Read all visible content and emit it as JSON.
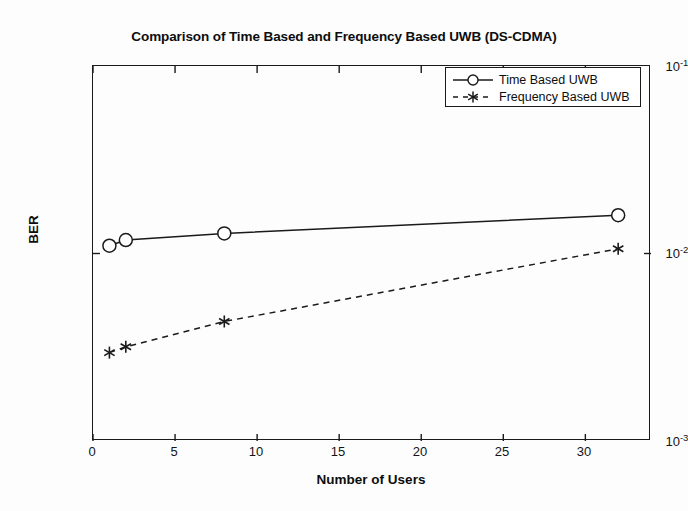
{
  "chart_data": {
    "type": "line",
    "title": "Comparison of Time Based and Frequency Based UWB (DS-CDMA)",
    "xlabel": "Number of Users",
    "ylabel": "BER",
    "yscale": "log",
    "xlim": [
      0,
      34
    ],
    "ylim": [
      0.001,
      0.1
    ],
    "grid": false,
    "legend_position": "top-right",
    "xticks": [
      "0",
      "5",
      "10",
      "15",
      "20",
      "25",
      "30"
    ],
    "xtick_values": [
      0,
      5,
      10,
      15,
      20,
      25,
      30
    ],
    "yticks": [
      "10-1",
      "10-2",
      "10-3"
    ],
    "ytick_values": [
      0.1,
      0.01,
      0.001
    ],
    "ytick_mantissa": "10",
    "ytick_exponents": [
      "-1",
      "-2",
      "-3"
    ],
    "x": [
      1,
      2,
      8,
      32
    ],
    "series": [
      {
        "name": "Time Based UWB",
        "marker": "circle",
        "linestyle": "solid",
        "color": "#1a1a1a",
        "values": [
          0.011,
          0.0118,
          0.0128,
          0.016
        ]
      },
      {
        "name": "Frequency Based UWB",
        "marker": "asterisk",
        "linestyle": "dashed",
        "color": "#1a1a1a",
        "values": [
          0.00296,
          0.00318,
          0.00434,
          0.0106
        ]
      }
    ]
  },
  "legend": {
    "entries": [
      {
        "label": "Time Based UWB"
      },
      {
        "label": "Frequency Based UWB"
      }
    ]
  },
  "colors": {
    "background": "#fdfdfd",
    "axis": "#1a1a1a",
    "text": "#0d0d0d"
  }
}
